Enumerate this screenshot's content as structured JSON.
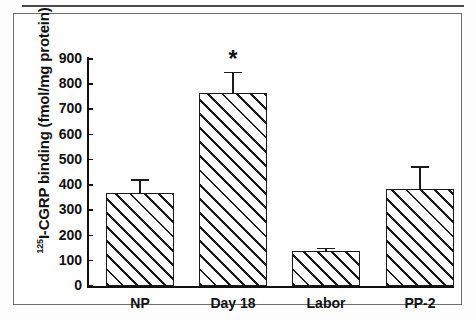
{
  "figure": {
    "y_axis_title_prefix": "125",
    "y_axis_title_main": "I-CGRP binding (fmol/mg protein)"
  },
  "chart_data": {
    "type": "bar",
    "title": "",
    "xlabel": "",
    "ylabel": "125I-CGRP binding (fmol/mg protein)",
    "ylim": [
      0,
      900
    ],
    "yticks": [
      0,
      100,
      200,
      300,
      400,
      500,
      600,
      700,
      800,
      900
    ],
    "ytick_labels": [
      "0",
      "100",
      "200",
      "300",
      "400",
      "500",
      "600",
      "700",
      "800",
      "900"
    ],
    "grid": false,
    "legend": null,
    "categories": [
      "NP",
      "Day 18",
      "Labor",
      "PP-2"
    ],
    "values": [
      370,
      765,
      140,
      385
    ],
    "errors": [
      55,
      85,
      12,
      90
    ],
    "annotations": [
      {
        "category": "Day 18",
        "text": "*",
        "meaning": "significant"
      }
    ],
    "bar_style": "white fill with diagonal hatch, black outline"
  }
}
